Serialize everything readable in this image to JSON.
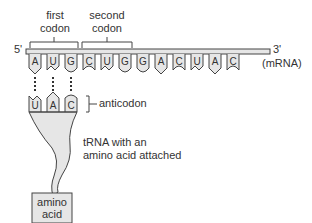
{
  "labels": {
    "first_codon_line1": "first",
    "first_codon_line2": "codon",
    "second_codon_line1": "second",
    "second_codon_line2": "codon",
    "five_prime": "5'",
    "three_prime": "3'",
    "mrna": "(mRNA)",
    "anticodon": "anticodon",
    "trna_line1": "tRNA with an",
    "trna_line2": "amino acid attached",
    "amino_line1": "amino",
    "amino_line2": "acid"
  },
  "mrna_bases": [
    "A",
    "U",
    "G",
    "C",
    "U",
    "G",
    "G",
    "A",
    "C",
    "U",
    "A",
    "C"
  ],
  "anticodon_bases": [
    "U",
    "A",
    "C"
  ],
  "colors": {
    "fill": "#e6e6e6",
    "stroke": "#444444"
  }
}
